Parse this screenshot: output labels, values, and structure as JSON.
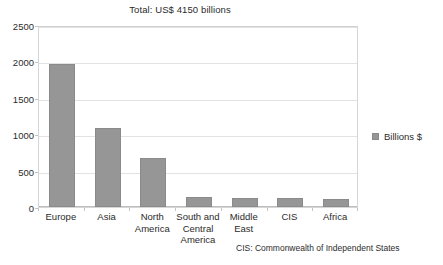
{
  "chart_data": {
    "type": "bar",
    "title": "Total: US$ 4150 billions",
    "xlabel": "",
    "ylabel": "",
    "categories": [
      "Europe",
      "Asia",
      "North America",
      "South and Central America",
      "Middle East",
      "CIS",
      "Africa"
    ],
    "values": [
      1960,
      1085,
      680,
      140,
      125,
      120,
      110
    ],
    "series": [
      {
        "name": "Billions $",
        "values": [
          1960,
          1085,
          680,
          140,
          125,
          120,
          110
        ],
        "color": "#969696"
      }
    ],
    "ylim": [
      0,
      2500
    ],
    "yticks": [
      0,
      500,
      1000,
      1500,
      2000,
      2500
    ],
    "ytick_labels": [
      "0",
      "500",
      "1000",
      "1500",
      "2000",
      "2500"
    ],
    "grid": true,
    "grid_axis": "y",
    "legend": {
      "position": "right",
      "entries": [
        {
          "label": "Billions $",
          "color": "#969696"
        }
      ]
    },
    "annotations": [
      {
        "text": "CIS: Commonwealth of Independent States",
        "position": "bottom-right"
      }
    ]
  },
  "title": "Total: US$ 4150 billions",
  "legend_label": "Billions $",
  "footnote": "CIS: Commonwealth of Independent States",
  "ytick_labels": [
    "2500",
    "2000",
    "1500",
    "1000",
    "500",
    "0"
  ],
  "xtick_labels": [
    "Europe",
    "Asia",
    "North America",
    "South and Central America",
    "Middle East",
    "CIS",
    "Africa"
  ],
  "colors": {
    "bar_fill": "#969696",
    "bar_border": "#8a8a8a",
    "gridline": "#e3e3e3",
    "frame": "#d6d6d6",
    "text": "#2b2b2b"
  }
}
